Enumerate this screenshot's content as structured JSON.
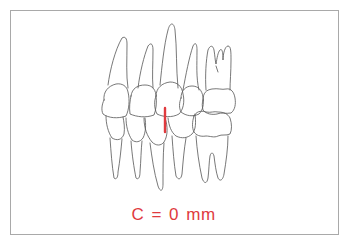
{
  "diagram": {
    "teeth_upper_count": 5,
    "teeth_lower_count": 5,
    "measurement_marker": {
      "color": "#e03a3e",
      "orientation": "vertical"
    }
  },
  "caption": {
    "text": "C  =  0 mm",
    "color": "#e03a3e"
  },
  "colors": {
    "outline": "#555555",
    "frame": "#a9a9a9",
    "accent": "#e03a3e"
  }
}
